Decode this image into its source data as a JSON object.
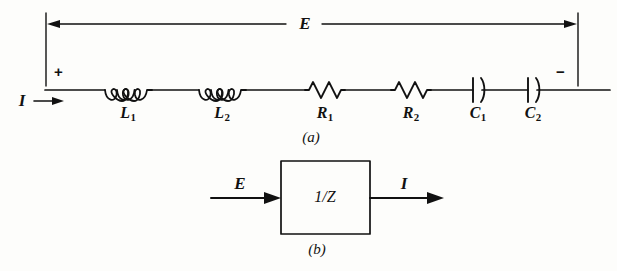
{
  "figure": {
    "caption_a": "(a)",
    "caption_b": "(b)",
    "background_color": "#fdfdfb",
    "ink_color": "#111111"
  },
  "circuit_a": {
    "voltage_label": "E",
    "current_label": "I",
    "polarity_positive": "+",
    "polarity_negative": "−",
    "components": [
      {
        "type": "inductor",
        "label": "L",
        "subscript": "1",
        "loops": 4,
        "x_center": 128
      },
      {
        "type": "inductor",
        "label": "L",
        "subscript": "2",
        "loops": 4,
        "x_center": 222
      },
      {
        "type": "resistor",
        "label": "R",
        "subscript": "1",
        "peaks": 3,
        "x_center": 325
      },
      {
        "type": "resistor",
        "label": "R",
        "subscript": "2",
        "peaks": 3,
        "x_center": 411
      },
      {
        "type": "capacitor",
        "label": "C",
        "subscript": "1",
        "x_center": 477
      },
      {
        "type": "capacitor",
        "label": "C",
        "subscript": "2",
        "x_center": 532
      }
    ]
  },
  "block_b": {
    "input_label": "E",
    "output_label": "I",
    "block_text": "1/Z"
  }
}
